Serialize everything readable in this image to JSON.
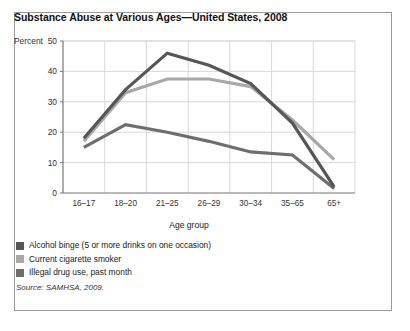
{
  "figure": {
    "title": "Substance Abuse at Various Ages—United States, 2008",
    "source": "Source: SAMHSA, 2009."
  },
  "chart_data": {
    "type": "line",
    "title": "Substance Abuse at Various Ages—United States, 2008",
    "xlabel": "Age group",
    "ylabel": "Percent",
    "categories": [
      "16–17",
      "18–20",
      "21–25",
      "26–29",
      "30–34",
      "35–65",
      "65+"
    ],
    "ylim": [
      0,
      50
    ],
    "yticks": [
      0,
      10,
      20,
      30,
      40,
      50
    ],
    "ytick_labels": [
      "0",
      "10",
      "20",
      "30",
      "40",
      "50"
    ],
    "grid": true,
    "legend_position": "below",
    "series": [
      {
        "name": "Alcohol binge (5 or more drinks on one occasion)",
        "color": "#565656",
        "values": [
          18,
          34,
          46,
          42,
          36,
          23,
          2
        ]
      },
      {
        "name": "Current cigarette smoker",
        "color": "#a8a8a8",
        "values": [
          17,
          33,
          37.5,
          37.5,
          35,
          24,
          11
        ]
      },
      {
        "name": "Illegal drug use, past month",
        "color": "#6e6e6e",
        "values": [
          15,
          22.5,
          20,
          17,
          13.5,
          12.5,
          1.5
        ]
      }
    ]
  },
  "axis": {
    "y_title": "Percent",
    "x_title": "Age group"
  },
  "colors": {
    "grid": "#d8d8d8",
    "axis": "#777777",
    "border": "#9a9a9a",
    "text": "#222222"
  }
}
